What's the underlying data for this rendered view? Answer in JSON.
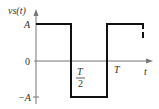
{
  "diagram": {
    "type": "square-wave-signal",
    "y_axis_label": "vs(t)",
    "x_axis_label": "t",
    "y_ticks": [
      "A",
      "0",
      "−A"
    ],
    "x_ticks": [
      {
        "numerator": "T",
        "denominator": "2"
      },
      {
        "label": "T"
      }
    ],
    "signal": [
      {
        "from": "0",
        "to": "T/2",
        "value": "A"
      },
      {
        "from": "T/2",
        "to": "T",
        "value": "−A"
      },
      {
        "from": "T",
        "to": "3T/2",
        "value": "A"
      }
    ],
    "continuation": "dashed"
  },
  "colors": {
    "signal": "#111111",
    "axis": "#777777",
    "text": "#333333"
  }
}
